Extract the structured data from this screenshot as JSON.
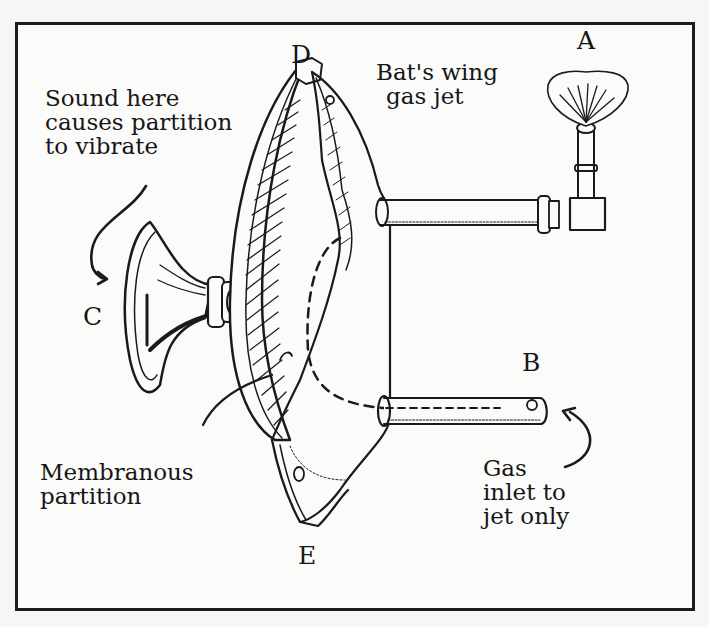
{
  "figure": {
    "labels": {
      "A": "A",
      "B": "B",
      "C": "C",
      "D": "D",
      "E": "E"
    },
    "captions": {
      "sound": [
        "Sound here",
        "causes partition",
        "to vibrate"
      ],
      "jet": [
        "Bat's wing",
        "gas jet"
      ],
      "membrane": [
        "Membranous",
        "partition"
      ],
      "inlet": [
        "Gas",
        "inlet to",
        "jet only"
      ]
    },
    "colors": {
      "ink": "#1a1a1a",
      "paper": "#fbfbfa"
    }
  }
}
